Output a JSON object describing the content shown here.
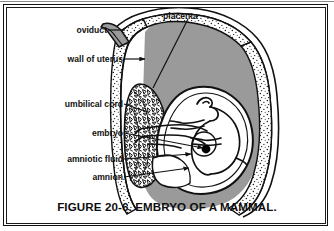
{
  "figure": {
    "caption": "FIGURE 20-6.  EMBRYO OF A MAMMAL.",
    "title": "Embryo of a Mammal",
    "number": "20-6"
  },
  "colors": {
    "ink": "#111111",
    "uterus_cavity_gray": "#9a9a9a",
    "uterus_wall_stipple": "#ffffff",
    "amniotic_sac_white": "#ffffff",
    "eye_dot": "#000000",
    "frame": "#111111",
    "background": "#ffffff"
  },
  "labels": [
    {
      "id": "placenta",
      "text": "placenta",
      "x": 160,
      "y": 9,
      "align": "left"
    },
    {
      "id": "oviduct",
      "text": "oviduct",
      "x": 106,
      "y": 28,
      "align": "right"
    },
    {
      "id": "wall-of-uterus",
      "text": "wall of uterus",
      "x": 122,
      "y": 57,
      "align": "right"
    },
    {
      "id": "umbilical-cord",
      "text": "umbilical cord",
      "x": 122,
      "y": 102,
      "align": "right"
    },
    {
      "id": "embryo",
      "text": "embryo",
      "x": 122,
      "y": 131,
      "align": "right"
    },
    {
      "id": "amniotic-fluid",
      "text": "amniotic fluid",
      "x": 122,
      "y": 157,
      "align": "right"
    },
    {
      "id": "amnion",
      "text": "amnion",
      "x": 122,
      "y": 175,
      "align": "right"
    }
  ],
  "leader_lines": [
    {
      "id": "leader-placenta",
      "from": [
        188,
        18
      ],
      "to": [
        146,
        86
      ],
      "arrow": false
    },
    {
      "id": "leader-oviduct",
      "from": [
        108,
        30
      ],
      "to": [
        128,
        30
      ],
      "arrow": false
    },
    {
      "id": "leader-wall-of-uterus",
      "from": [
        124,
        59
      ],
      "to": [
        146,
        59
      ],
      "arrow": true
    },
    {
      "id": "leader-umbilical-cord",
      "from": [
        124,
        104
      ],
      "to": [
        178,
        120
      ],
      "arrow": false
    },
    {
      "id": "leader-embryo",
      "from": [
        124,
        133
      ],
      "to": [
        208,
        144
      ],
      "arrow": true
    },
    {
      "id": "leader-amniotic-fluid",
      "from": [
        124,
        159
      ],
      "to": [
        196,
        152
      ],
      "arrow": true
    },
    {
      "id": "leader-amnion",
      "from": [
        124,
        177
      ],
      "to": [
        190,
        168
      ],
      "arrow": true
    }
  ],
  "structures": [
    {
      "id": "uterus-cavity",
      "name": "uterine cavity",
      "fill": "gray"
    },
    {
      "id": "uterus-wall",
      "name": "wall of uterus",
      "fill": "stippled-white"
    },
    {
      "id": "oviduct-tube",
      "name": "oviduct",
      "fill": "gray"
    },
    {
      "id": "placenta-mass",
      "name": "placenta",
      "fill": "mottled"
    },
    {
      "id": "amniotic-sac",
      "name": "amnion + amniotic fluid",
      "fill": "white"
    },
    {
      "id": "fetus",
      "name": "embryo",
      "fill": "white"
    },
    {
      "id": "umbilical-cord-strands",
      "name": "umbilical cord",
      "fill": "white"
    }
  ]
}
